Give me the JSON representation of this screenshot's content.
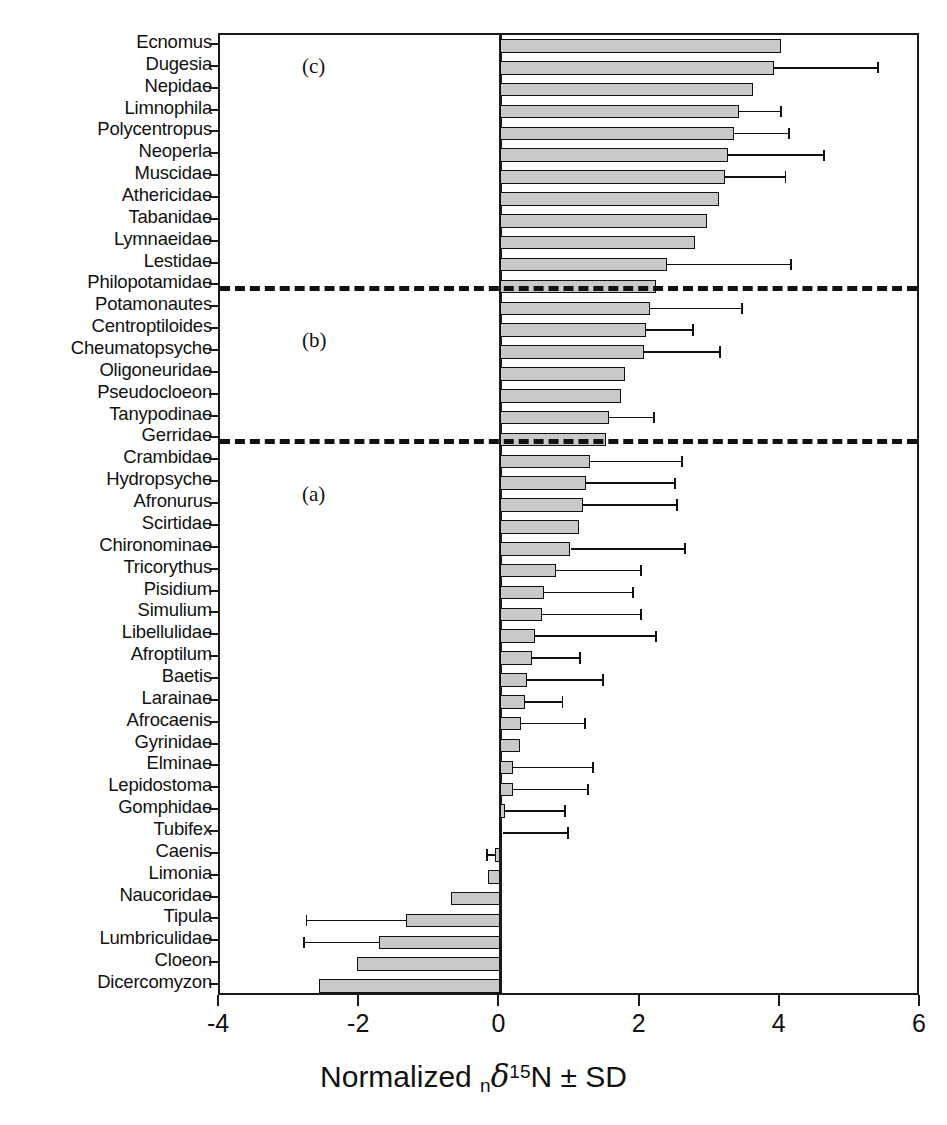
{
  "figure": {
    "panel_labels": [
      {
        "text": "(c)",
        "x": 300,
        "y": 52
      },
      {
        "text": "(b)",
        "x": 300,
        "y": 326
      },
      {
        "text": "(a)",
        "x": 300,
        "y": 480
      }
    ],
    "separator_values": [
      11.5,
      18.5
    ],
    "bar_fill": "#c9c9c9",
    "bar_stroke": "#111111",
    "axis_color": "#1a1a1a"
  },
  "chart_data": {
    "type": "bar",
    "orientation": "horizontal",
    "title": "",
    "xlabel": "Normalized ₙδ¹⁵N ± SD",
    "ylabel": "",
    "xlim": [
      -4,
      6
    ],
    "xticks": [
      -4,
      -2,
      0,
      2,
      4,
      6
    ],
    "xticklabels": [
      "-4",
      "-2",
      "0",
      "2",
      "4",
      "6"
    ],
    "grid": false,
    "legend": null,
    "groups": [
      {
        "label": "(c)",
        "members": [
          "Ecnomus",
          "Dugesia",
          "Nepidae",
          "Limnophila",
          "Polycentropus",
          "Neoperla",
          "Muscidae",
          "Athericidae",
          "Tabanidae",
          "Lymnaeidae",
          "Lestidae",
          "Philopotamidae"
        ]
      },
      {
        "label": "(b)",
        "members": [
          "Potamonautes",
          "Centroptiloides",
          "Cheumatopsyche",
          "Oligoneuridae",
          "Pseudocloeon",
          "Tanypodinae",
          "Gerridae"
        ]
      },
      {
        "label": "(a)",
        "members": [
          "Crambidae",
          "Hydropsyche",
          "Afronurus",
          "Scirtidae",
          "Chironominae",
          "Tricorythus",
          "Pisidium",
          "Simulium",
          "Libellulidae",
          "Afroptilum",
          "Baetis",
          "Larainae",
          "Afrocaenis",
          "Gyrinidae",
          "Elminae",
          "Lepidostoma",
          "Gomphidae",
          "Tubifex",
          "Caenis",
          "Limonia",
          "Naucoridae",
          "Tipula",
          "Lumbriculidae",
          "Cloeon",
          "Dicercomyzon"
        ]
      }
    ],
    "categories": [
      "Ecnomus",
      "Dugesia",
      "Nepidae",
      "Limnophila",
      "Polycentropus",
      "Neoperla",
      "Muscidae",
      "Athericidae",
      "Tabanidae",
      "Lymnaeidae",
      "Lestidae",
      "Philopotamidae",
      "Potamonautes",
      "Centroptiloides",
      "Cheumatopsyche",
      "Oligoneuridae",
      "Pseudocloeon",
      "Tanypodinae",
      "Gerridae",
      "Crambidae",
      "Hydropsyche",
      "Afronurus",
      "Scirtidae",
      "Chironominae",
      "Tricorythus",
      "Pisidium",
      "Simulium",
      "Libellulidae",
      "Afroptilum",
      "Baetis",
      "Larainae",
      "Afrocaenis",
      "Gyrinidae",
      "Elminae",
      "Lepidostoma",
      "Gomphidae",
      "Tubifex",
      "Caenis",
      "Limonia",
      "Naucoridae",
      "Tipula",
      "Lumbriculidae",
      "Cloeon",
      "Dicercomyzon"
    ],
    "values": [
      4.0,
      3.9,
      3.6,
      3.4,
      3.33,
      3.25,
      3.2,
      3.12,
      2.95,
      2.78,
      2.38,
      2.22,
      2.14,
      2.08,
      2.05,
      1.78,
      1.72,
      1.55,
      1.5,
      1.28,
      1.22,
      1.18,
      1.12,
      1.0,
      0.8,
      0.62,
      0.6,
      0.5,
      0.45,
      0.38,
      0.35,
      0.3,
      0.28,
      0.18,
      0.18,
      0.06,
      0.03,
      -0.08,
      -0.18,
      -0.7,
      -1.34,
      -1.73,
      -2.05,
      -2.59
    ],
    "errors": [
      null,
      1.5,
      null,
      0.62,
      0.8,
      1.38,
      0.88,
      null,
      null,
      null,
      1.78,
      null,
      1.32,
      0.68,
      1.1,
      null,
      null,
      0.65,
      null,
      1.32,
      1.28,
      1.35,
      null,
      1.65,
      1.22,
      1.28,
      1.42,
      1.73,
      0.7,
      1.1,
      0.55,
      0.92,
      null,
      1.15,
      1.08,
      0.88,
      0.95,
      0.12,
      null,
      null,
      1.44,
      1.08,
      null,
      null
    ]
  }
}
